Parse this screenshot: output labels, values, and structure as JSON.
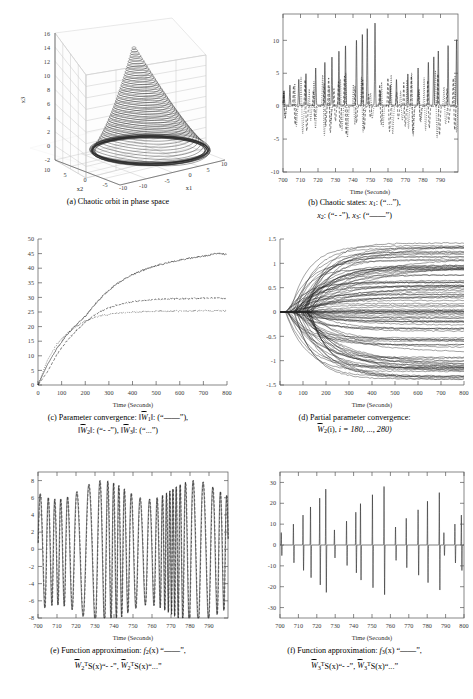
{
  "figure": {
    "panel_count": 6
  },
  "chart_data": [
    {
      "id": "a",
      "type": "line",
      "projection": "3d",
      "title": "Chaotic orbit in phase space",
      "caption": "(a) Chaotic orbit in phase space",
      "xlabel": "x1",
      "ylabel": "x2",
      "zlabel": "x3",
      "xticks": [
        -10,
        -5,
        0,
        5,
        10
      ],
      "yticks": [
        10,
        5,
        0,
        -5,
        -10
      ],
      "zticks": [
        -2,
        0,
        2,
        4,
        6,
        8,
        10,
        12,
        14,
        16
      ],
      "xlim": [
        -10,
        10
      ],
      "ylim": [
        -10,
        10
      ],
      "zlim": [
        -2,
        16
      ],
      "grid": true,
      "description": "Dense bell/cone shaped chaotic attractor, apex near x3=15, base ring at x3=0",
      "series": [
        {
          "name": "chaotic orbit",
          "style": "solid",
          "n_loops": 34,
          "apex_z": 15,
          "base_z": 0
        }
      ]
    },
    {
      "id": "b",
      "type": "line",
      "title": "Chaotic states",
      "caption_parts": {
        "lead": "(b) Chaotic states: ",
        "s1_sym": "x",
        "s1_sub": "1",
        "s1_style": "(“...”),",
        "s2_sym": "x",
        "s2_sub": "2",
        "s2_style": "(“- -”),",
        "s3_sym": "x",
        "s3_sub": "3",
        "s3_style": "(“——”)"
      },
      "xlabel": "Time (Seconds)",
      "ylabel": "",
      "xticks": [
        700,
        710,
        720,
        730,
        740,
        750,
        760,
        770,
        780,
        790
      ],
      "yticks": [
        -10,
        -5,
        0,
        5,
        10
      ],
      "xlim": [
        700,
        800
      ],
      "ylim": [
        -10,
        14
      ],
      "grid": false,
      "series": [
        {
          "name": "x1",
          "style": "dotted",
          "peak_max": 9,
          "peak_min": -8
        },
        {
          "name": "x2",
          "style": "dashed",
          "peak_max": 7,
          "peak_min": -8
        },
        {
          "name": "x3",
          "style": "solid",
          "peak_max": 13.5,
          "peak_min": -0.5
        }
      ]
    },
    {
      "id": "c",
      "type": "line",
      "title": "Parameter convergence",
      "caption_parts": {
        "lead": "(c) Parameter convergence: ",
        "s1_sym": "W",
        "s1_sub": "1",
        "s1_style": "(“——”),",
        "s2_sym": "W",
        "s2_sub": "2",
        "s2_style": "(“- -”),",
        "s3_sym": "W",
        "s3_sub": "3",
        "s3_style": "(“...”)"
      },
      "xlabel": "Time (Seconds)",
      "xticks": [
        0,
        100,
        200,
        300,
        400,
        500,
        600,
        700,
        800
      ],
      "yticks": [
        0,
        5,
        10,
        15,
        20,
        25,
        30,
        35,
        40,
        45,
        50
      ],
      "xlim": [
        0,
        800
      ],
      "ylim": [
        0,
        50
      ],
      "grid": false,
      "series": [
        {
          "name": "||W1||",
          "style": "solid",
          "x": [
            0,
            40,
            80,
            120,
            160,
            200,
            240,
            280,
            320,
            360,
            400,
            440,
            480,
            520,
            560,
            600,
            640,
            680,
            720,
            760,
            800
          ],
          "y": [
            0,
            7,
            12.5,
            17,
            20.5,
            23.5,
            27.5,
            31,
            33.8,
            36,
            37.8,
            39.2,
            40.4,
            41.3,
            42.1,
            42.8,
            43.4,
            43.9,
            44.4,
            45.2,
            44.7
          ]
        },
        {
          "name": "||W2||",
          "style": "dashed",
          "x": [
            0,
            40,
            80,
            120,
            160,
            200,
            240,
            280,
            320,
            360,
            400,
            440,
            480,
            520,
            560,
            600,
            640,
            680,
            720,
            760,
            800
          ],
          "y": [
            0,
            4.5,
            10.5,
            14.8,
            18.5,
            21.5,
            24,
            25.8,
            27,
            27.9,
            28.5,
            29,
            29.2,
            29.4,
            29.5,
            29.6,
            29.6,
            29.7,
            29.8,
            29.8,
            29.6
          ]
        },
        {
          "name": "||W3||",
          "style": "dotted",
          "x": [
            0,
            40,
            80,
            120,
            160,
            200,
            240,
            280,
            320,
            360,
            400,
            440,
            480,
            520,
            560,
            600,
            640,
            680,
            720,
            760,
            800
          ],
          "y": [
            0,
            8.5,
            14,
            17.5,
            20,
            22,
            23.2,
            24,
            24.4,
            24.7,
            24.9,
            25.1,
            25.2,
            25.3,
            25.3,
            25.4,
            25.4,
            25.4,
            25.4,
            25.4,
            25.3
          ]
        }
      ]
    },
    {
      "id": "d",
      "type": "line",
      "title": "Partial parameter convergence",
      "caption_parts": {
        "lead": "(d) Partial parameter convergence:",
        "sym": "W",
        "sub": "2",
        "args": "(i), ",
        "range_label": "i = 180, ..., 280)"
      },
      "xlabel": "Time (Seconds)",
      "xticks": [
        0,
        100,
        200,
        300,
        400,
        500,
        600,
        700,
        800
      ],
      "yticks": [
        -1.5,
        -1,
        -0.5,
        0,
        0.5,
        1,
        1.5
      ],
      "xlim": [
        0,
        800
      ],
      "ylim": [
        -1.5,
        1.5
      ],
      "grid": false,
      "n_curves": 101,
      "description": "101 weight trajectories fanning out from 0 at t=0 to a spread between -1.4 and 1.4 at t=800",
      "spread_at_800": [
        -1.4,
        1.4
      ]
    },
    {
      "id": "e",
      "type": "line",
      "title": "Function approximation f2",
      "caption_parts": {
        "lead": "(e) Function approximation: ",
        "f_sym": "f",
        "f_sub": "2",
        "f_arg": "(x) “——”,",
        "w1_sym": "W",
        "w1_sub": "2",
        "w1_sup": "T",
        "w1_rest": "S(x)“- -”,",
        "w2_sym": "W",
        "w2_sub": "2",
        "w2_sup": "T",
        "w2_rest": "S(x)“...”"
      },
      "xlabel": "Time (Seconds)",
      "xticks": [
        700,
        710,
        720,
        730,
        740,
        750,
        760,
        770,
        780,
        790
      ],
      "yticks": [
        -8,
        -6,
        -4,
        -2,
        0,
        2,
        4,
        6,
        8
      ],
      "xlim": [
        700,
        800
      ],
      "ylim": [
        -8,
        9
      ],
      "grid": false,
      "description": "Large oscillation, amplitude about 8, irregular chaotic period near 4-6 s"
    },
    {
      "id": "f",
      "type": "line",
      "title": "Function approximation f3",
      "caption_parts": {
        "lead": "(f) Function approximation: ",
        "f_sym": "f",
        "f_sub": "3",
        "f_arg": "(x) “——”,",
        "w1_sym": "W",
        "w1_sub": "3",
        "w1_sup": "T",
        "w1_rest": "S(x)“- -”,",
        "w2_sym": "W",
        "w2_sub": "3",
        "w2_sup": "T",
        "w2_rest": "S(x)“...”"
      },
      "xlabel": "Time (Seconds)",
      "xticks": [
        700,
        710,
        720,
        730,
        740,
        750,
        760,
        770,
        780,
        790,
        800
      ],
      "yticks": [
        -30,
        -20,
        -10,
        0,
        10,
        20,
        30
      ],
      "xlim": [
        700,
        800
      ],
      "ylim": [
        -35,
        35
      ],
      "grid": false,
      "description": "Near-zero baseline with sharp bipolar spikes reaching +30 / -33"
    }
  ]
}
